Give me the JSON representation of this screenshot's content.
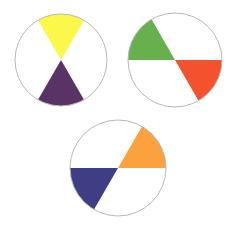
{
  "diagram": {
    "title": "",
    "stroke_color": "#b8b8b8",
    "background": "#ffffff",
    "wheels": [
      {
        "name": "yellow-violet",
        "cx": 61,
        "cy": 60,
        "r": 46,
        "sectors": [
          {
            "color_name": "yellow",
            "color": "#fbf84a",
            "start_deg": -120,
            "end_deg": -60
          },
          {
            "color_name": "violet",
            "color": "#5a3366",
            "start_deg": 60,
            "end_deg": 120
          }
        ]
      },
      {
        "name": "green-red",
        "cx": 175,
        "cy": 60,
        "r": 47,
        "sectors": [
          {
            "color_name": "green",
            "color": "#67b04e",
            "start_deg": 180,
            "end_deg": 240
          },
          {
            "color_name": "red",
            "color": "#f4512e",
            "start_deg": 0,
            "end_deg": 60
          }
        ]
      },
      {
        "name": "blue-orange",
        "cx": 118,
        "cy": 168,
        "r": 48,
        "sectors": [
          {
            "color_name": "orange",
            "color": "#fba23f",
            "start_deg": -60,
            "end_deg": 0
          },
          {
            "color_name": "blue",
            "color": "#3f3d84",
            "start_deg": 120,
            "end_deg": 180
          }
        ]
      }
    ]
  }
}
